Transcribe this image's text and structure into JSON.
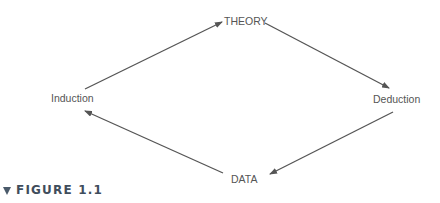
{
  "diagram": {
    "nodes": {
      "theory": "THEORY",
      "induction": "Induction",
      "deduction": "Deduction",
      "data": "DATA"
    },
    "edges": [
      {
        "from": "Induction",
        "to": "THEORY"
      },
      {
        "from": "THEORY",
        "to": "Deduction"
      },
      {
        "from": "Deduction",
        "to": "DATA"
      },
      {
        "from": "DATA",
        "to": "Induction"
      }
    ],
    "colors": {
      "arrow": "#555555",
      "label": "#555555",
      "caption": "#3f4d5c"
    }
  },
  "caption": {
    "icon": "triangle-down-icon",
    "text": "FIGURE 1.1"
  }
}
